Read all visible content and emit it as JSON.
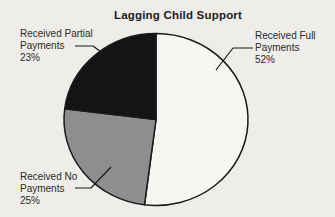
{
  "page": {
    "background": "#efede9"
  },
  "chart_data": {
    "type": "pie",
    "title": "Lagging Child Support",
    "start_angle_deg": 0,
    "direction": "clockwise",
    "slices": [
      {
        "label": "Received Full Payments",
        "value": 52,
        "color": "#f7f6f2"
      },
      {
        "label": "Received No Payments",
        "value": 25,
        "color": "#8e8e8e"
      },
      {
        "label": "Received Partial Payments",
        "value": 23,
        "color": "#141414"
      }
    ],
    "outline_color": "#1a1a1a",
    "legend_position": "callout-labels"
  },
  "callouts": {
    "partial": {
      "line1": "Received Partial",
      "line2": "Payments",
      "pct": "23%"
    },
    "full": {
      "line1": "Received Full",
      "line2": "Payments",
      "pct": "52%"
    },
    "no": {
      "line1": "Received No",
      "line2": "Payments",
      "pct": "25%"
    }
  }
}
